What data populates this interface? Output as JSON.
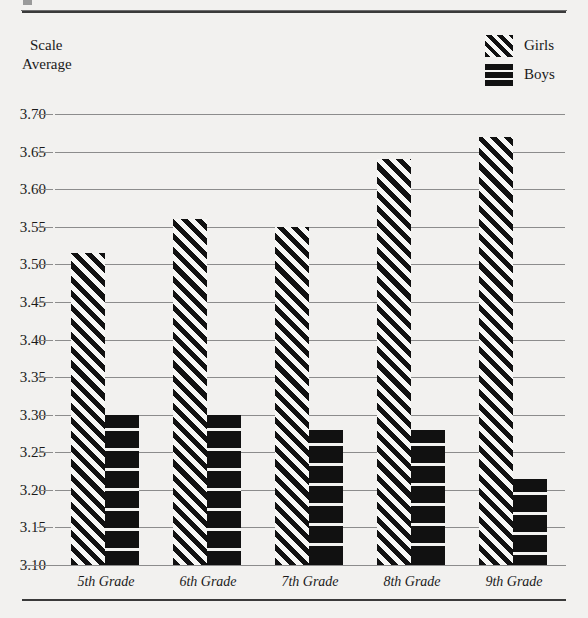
{
  "figure": {
    "y_axis_title_line1": "Scale",
    "y_axis_title_line2": "Average"
  },
  "legend": {
    "position": "top-right",
    "entries": [
      {
        "label": "Girls",
        "pattern": "diagonal-hatch",
        "color": "#111111"
      },
      {
        "label": "Boys",
        "pattern": "solid-black",
        "color": "#111111"
      }
    ]
  },
  "chart_data": {
    "type": "bar",
    "title": "",
    "xlabel": "",
    "ylabel": "Scale Average",
    "categories": [
      "5th Grade",
      "6th Grade",
      "7th Grade",
      "8th Grade",
      "9th Grade"
    ],
    "series": [
      {
        "name": "Girls",
        "values": [
          3.515,
          3.56,
          3.55,
          3.64,
          3.67
        ]
      },
      {
        "name": "Boys",
        "values": [
          3.3,
          3.3,
          3.28,
          3.28,
          3.215
        ]
      }
    ],
    "ylim": [
      3.1,
      3.7
    ],
    "ytick_labels": [
      "3.70",
      "3.65",
      "3.60",
      "3.55",
      "3.50",
      "3.45",
      "3.40",
      "3.35",
      "3.30",
      "3.25",
      "3.20",
      "3.15",
      "3.10"
    ],
    "ytick_values": [
      3.7,
      3.65,
      3.6,
      3.55,
      3.5,
      3.45,
      3.4,
      3.35,
      3.3,
      3.25,
      3.2,
      3.15,
      3.1
    ],
    "grid": true,
    "legend_position": "top-right",
    "bars_truncated_at_baseline": true
  }
}
